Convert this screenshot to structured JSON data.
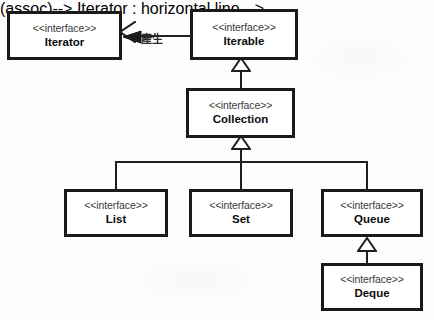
{
  "diagram": {
    "stereotype_label": "<<interface>>",
    "background_color": "#fdfdfd",
    "line_color": "#1f1f1f",
    "box_border_color": "#1a1a1a",
    "nodes": [
      {
        "id": "iterator",
        "name": "Iterator",
        "stereotype": "<<interface>>"
      },
      {
        "id": "iterable",
        "name": "Iterable",
        "stereotype": "<<interface>>"
      },
      {
        "id": "collection",
        "name": "Collection",
        "stereotype": "<<interface>>"
      },
      {
        "id": "list",
        "name": "List",
        "stereotype": "<<interface>>"
      },
      {
        "id": "set",
        "name": "Set",
        "stereotype": "<<interface>>"
      },
      {
        "id": "queue",
        "name": "Queue",
        "stereotype": "<<interface>>"
      },
      {
        "id": "deque",
        "name": "Deque",
        "stereotype": "<<interface>>"
      }
    ],
    "relationships": [
      {
        "id": "iterable-produces-iterator",
        "type": "association",
        "from": "Iterable",
        "to": "Iterator",
        "label": "產生",
        "arrow": "open-arrowhead-with-solid-navigability-triangle"
      },
      {
        "id": "collection-to-iterable",
        "type": "generalization",
        "from": "Collection",
        "to": "Iterable",
        "label": ""
      },
      {
        "id": "list-to-collection",
        "type": "generalization",
        "from": "List",
        "to": "Collection",
        "label": ""
      },
      {
        "id": "set-to-collection",
        "type": "generalization",
        "from": "Set",
        "to": "Collection",
        "label": ""
      },
      {
        "id": "queue-to-collection",
        "type": "generalization",
        "from": "Queue",
        "to": "Collection",
        "label": ""
      },
      {
        "id": "deque-to-queue",
        "type": "generalization",
        "from": "Deque",
        "to": "Queue",
        "label": ""
      }
    ]
  }
}
